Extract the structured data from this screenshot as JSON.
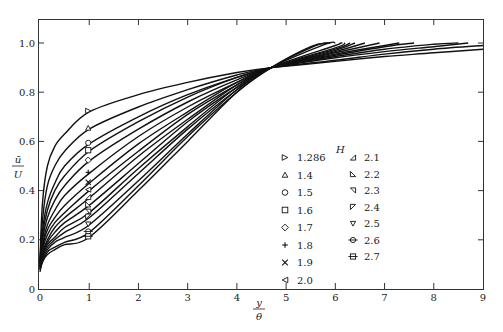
{
  "chart_data": {
    "type": "line",
    "title": "",
    "xlabel": "y/θ",
    "ylabel": "ū/U",
    "xlim": [
      0,
      9
    ],
    "ylim": [
      0,
      1.1
    ],
    "xticks": [
      0,
      1,
      2,
      3,
      4,
      5,
      6,
      7,
      8,
      9
    ],
    "yticks": [
      0,
      0.2,
      0.4,
      0.6,
      0.8,
      1.0
    ],
    "ytick_labels": [
      "0",
      "0.2",
      "0.4",
      "0.6",
      "0.8",
      "1.0"
    ],
    "grid": false,
    "legend": {
      "title": "H",
      "position": "lower-right-inside"
    },
    "x": [
      0,
      0.05,
      0.15,
      0.3,
      0.5,
      1,
      2,
      3,
      4,
      4.7
    ],
    "series": [
      {
        "name": "1.286",
        "marker": "triangle-right",
        "values": [
          0.12,
          0.35,
          0.5,
          0.58,
          0.63,
          0.72,
          0.79,
          0.84,
          0.88,
          0.9
        ],
        "tail": [
          [
            6,
            0.925
          ],
          [
            7,
            0.945
          ],
          [
            8,
            0.96
          ],
          [
            9,
            0.975
          ]
        ]
      },
      {
        "name": "1.4",
        "marker": "triangle-up",
        "values": [
          0.11,
          0.28,
          0.42,
          0.5,
          0.56,
          0.65,
          0.74,
          0.81,
          0.87,
          0.9
        ],
        "tail": [
          [
            6,
            0.93
          ],
          [
            7,
            0.955
          ],
          [
            8,
            0.975
          ],
          [
            9,
            0.99
          ]
        ]
      },
      {
        "name": "1.5",
        "marker": "circle",
        "values": [
          0.11,
          0.24,
          0.35,
          0.43,
          0.5,
          0.59,
          0.7,
          0.79,
          0.86,
          0.9
        ],
        "tail": [
          [
            6,
            0.94
          ],
          [
            7,
            0.965
          ],
          [
            8,
            0.985
          ],
          [
            8.7,
            1.0
          ]
        ]
      },
      {
        "name": "1.6",
        "marker": "square",
        "values": [
          0.1,
          0.22,
          0.32,
          0.4,
          0.46,
          0.56,
          0.68,
          0.78,
          0.86,
          0.9
        ],
        "tail": [
          [
            6,
            0.945
          ],
          [
            7,
            0.975
          ],
          [
            8,
            0.995
          ],
          [
            8.5,
            1.0
          ]
        ]
      },
      {
        "name": "1.7",
        "marker": "diamond",
        "values": [
          0.1,
          0.2,
          0.29,
          0.36,
          0.42,
          0.52,
          0.65,
          0.76,
          0.85,
          0.9
        ],
        "tail": [
          [
            6,
            0.95
          ],
          [
            7,
            0.985
          ],
          [
            7.6,
            1.0
          ]
        ]
      },
      {
        "name": "1.8",
        "marker": "plus",
        "values": [
          0.1,
          0.18,
          0.26,
          0.32,
          0.38,
          0.47,
          0.62,
          0.74,
          0.84,
          0.9
        ],
        "tail": [
          [
            6,
            0.955
          ],
          [
            7,
            0.99
          ],
          [
            7.3,
            1.0
          ]
        ]
      },
      {
        "name": "1.9",
        "marker": "cross",
        "values": [
          0.09,
          0.17,
          0.24,
          0.29,
          0.34,
          0.43,
          0.59,
          0.72,
          0.84,
          0.9
        ],
        "tail": [
          [
            6,
            0.96
          ],
          [
            6.9,
            1.0
          ]
        ]
      },
      {
        "name": "2.0",
        "marker": "triangle-left",
        "values": [
          0.09,
          0.16,
          0.22,
          0.27,
          0.31,
          0.4,
          0.56,
          0.71,
          0.83,
          0.9
        ],
        "tail": [
          [
            6,
            0.965
          ],
          [
            6.6,
            1.0
          ]
        ]
      },
      {
        "name": "2.1",
        "marker": "triangle-lower-left",
        "values": [
          0.09,
          0.15,
          0.2,
          0.25,
          0.29,
          0.37,
          0.54,
          0.69,
          0.83,
          0.9
        ],
        "tail": [
          [
            6,
            0.97
          ],
          [
            6.4,
            1.0
          ]
        ]
      },
      {
        "name": "2.2",
        "marker": "triangle-upper-left",
        "values": [
          0.09,
          0.14,
          0.19,
          0.23,
          0.27,
          0.34,
          0.51,
          0.68,
          0.82,
          0.9
        ],
        "tail": [
          [
            6,
            0.975
          ],
          [
            6.3,
            1.0
          ]
        ]
      },
      {
        "name": "2.3",
        "marker": "triangle-lower-right",
        "values": [
          0.08,
          0.13,
          0.18,
          0.21,
          0.25,
          0.31,
          0.49,
          0.66,
          0.82,
          0.9
        ],
        "tail": [
          [
            6,
            0.98
          ],
          [
            6.2,
            1.0
          ]
        ]
      },
      {
        "name": "2.4",
        "marker": "triangle-upper-right",
        "values": [
          0.08,
          0.13,
          0.17,
          0.2,
          0.23,
          0.29,
          0.47,
          0.65,
          0.81,
          0.9
        ],
        "tail": [
          [
            6,
            0.99
          ],
          [
            6.1,
            1.0
          ]
        ]
      },
      {
        "name": "2.5",
        "marker": "triangle-down",
        "values": [
          0.08,
          0.12,
          0.16,
          0.19,
          0.21,
          0.26,
          0.44,
          0.63,
          0.81,
          0.9
        ],
        "tail": [
          [
            5.8,
            0.995
          ],
          [
            6.0,
            1.0
          ]
        ]
      },
      {
        "name": "2.6",
        "marker": "circle-bar",
        "values": [
          0.08,
          0.11,
          0.15,
          0.17,
          0.19,
          0.23,
          0.42,
          0.62,
          0.8,
          0.9
        ],
        "tail": [
          [
            5.6,
            0.99
          ],
          [
            5.9,
            1.0
          ]
        ]
      },
      {
        "name": "2.7",
        "marker": "square-bar",
        "values": [
          0.07,
          0.11,
          0.14,
          0.16,
          0.18,
          0.21,
          0.4,
          0.6,
          0.8,
          0.9
        ],
        "tail": [
          [
            5.5,
            0.985
          ],
          [
            5.85,
            1.0
          ]
        ]
      }
    ],
    "annotations": []
  },
  "legend": {
    "title": "H",
    "col1": [
      {
        "marker": "triangle-right",
        "label": "1.286"
      },
      {
        "marker": "triangle-up",
        "label": "1.4"
      },
      {
        "marker": "circle",
        "label": "1.5"
      },
      {
        "marker": "square",
        "label": "1.6"
      },
      {
        "marker": "diamond",
        "label": "1.7"
      },
      {
        "marker": "plus",
        "label": "1.8"
      },
      {
        "marker": "cross",
        "label": "1.9"
      },
      {
        "marker": "triangle-left",
        "label": "2.0"
      }
    ],
    "col2": [
      {
        "marker": "triangle-lower-left",
        "label": "2.1"
      },
      {
        "marker": "triangle-upper-left",
        "label": "2.2"
      },
      {
        "marker": "triangle-lower-right",
        "label": "2.3"
      },
      {
        "marker": "triangle-upper-right",
        "label": "2.4"
      },
      {
        "marker": "triangle-down",
        "label": "2.5"
      },
      {
        "marker": "circle-bar",
        "label": "2.6"
      },
      {
        "marker": "square-bar",
        "label": "2.7"
      }
    ]
  },
  "axes": {
    "x_label_top": "y",
    "x_label_bottom": "θ",
    "y_label_top": "ū",
    "y_label_bottom": "U"
  }
}
